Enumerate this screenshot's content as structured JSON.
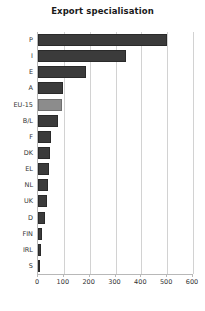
{
  "chart_data": {
    "type": "bar",
    "orientation": "horizontal",
    "title": "Export specialisation",
    "xlabel": "",
    "ylabel": "",
    "categories": [
      "P",
      "I",
      "E",
      "A",
      "EU-15",
      "B/L",
      "F",
      "DK",
      "EL",
      "NL",
      "UK",
      "D",
      "FIN",
      "IRL",
      "S"
    ],
    "values": [
      500,
      342,
      185,
      95,
      91,
      76,
      49,
      45,
      43,
      40,
      33,
      29,
      15,
      11,
      8
    ],
    "xlim": [
      0,
      600
    ],
    "xticks": [
      0,
      100,
      200,
      300,
      400,
      500,
      600
    ],
    "xtick_labels": [
      "0",
      "100",
      "200",
      "300",
      "400",
      "500",
      "600"
    ],
    "grid": true,
    "grid_axis": "x",
    "legend": false,
    "highlight_category": "EU-15",
    "colors": {
      "bar": "#3b3b3b",
      "bar_highlight": "#8c8c8c",
      "gridline": "#d2d2d2",
      "axis": "#b8b8b8",
      "text": "#333333",
      "title": "#1a1a1a",
      "background": "#ffffff"
    }
  }
}
